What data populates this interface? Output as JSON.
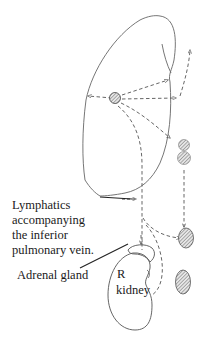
{
  "diagram": {
    "type": "anatomical lymphatic drainage sketch",
    "colors": {
      "stroke": "#555555",
      "text": "#1a1a1a",
      "node_fill": "#bdbdbd",
      "background": "#ffffff"
    },
    "labels": {
      "lymphatics_line1": "Lymphatics",
      "lymphatics_line2": "accompanying",
      "lymphatics_line3": "the inferior",
      "lymphatics_line4": "pulmonary vein.",
      "adrenal": "Adrenal gland",
      "kidney_r": "R",
      "kidney_word": "kidney"
    },
    "structures": [
      {
        "name": "right-lung-lower-lobe",
        "shape": "outline"
      },
      {
        "name": "hilar-lymph-node",
        "shape": "hatched-circle"
      },
      {
        "name": "node-1",
        "shape": "hatched-circle"
      },
      {
        "name": "node-2",
        "shape": "hatched-circle"
      },
      {
        "name": "node-3",
        "shape": "hatched-oval"
      },
      {
        "name": "node-4",
        "shape": "hatched-oval"
      },
      {
        "name": "adrenal-gland",
        "shape": "outline"
      },
      {
        "name": "right-kidney",
        "shape": "outline"
      }
    ]
  }
}
